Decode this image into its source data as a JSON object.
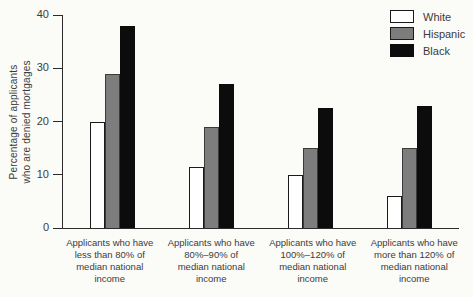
{
  "chart_data": {
    "type": "bar",
    "title": "",
    "ylabel_lines": [
      "Percentage of applicants",
      "who are denied mortgages"
    ],
    "y_axis": {
      "min": 0,
      "max": 40,
      "ticks": [
        40,
        30,
        20,
        10,
        0
      ]
    },
    "categories": [
      "Applicants who have\nless than 80% of\nmedian national\nincome",
      "Applicants who have\n80%–90% of\nmedian national\nincome",
      "Applicants who have\n100%–120% of\nmedian national\nincome",
      "Applicants who have\nmore than 120% of\nmedian national\nincome"
    ],
    "series": [
      {
        "name": "White",
        "color": "#ffffff",
        "border": "#1a1a1a",
        "values": [
          20,
          11.5,
          10,
          6
        ]
      },
      {
        "name": "Hispanic",
        "color": "#7d7d7d",
        "border": "#3a3a3a",
        "values": [
          29,
          19,
          15,
          15
        ]
      },
      {
        "name": "Black",
        "color": "#0c0c0c",
        "border": "#0c0c0c",
        "values": [
          38,
          27,
          22.5,
          23
        ]
      }
    ],
    "legend_position": "top-right",
    "grid": false
  },
  "colors": {
    "background": "#fbfbf8",
    "axis": "#2b2b2b",
    "text": "#3b3b3b"
  }
}
